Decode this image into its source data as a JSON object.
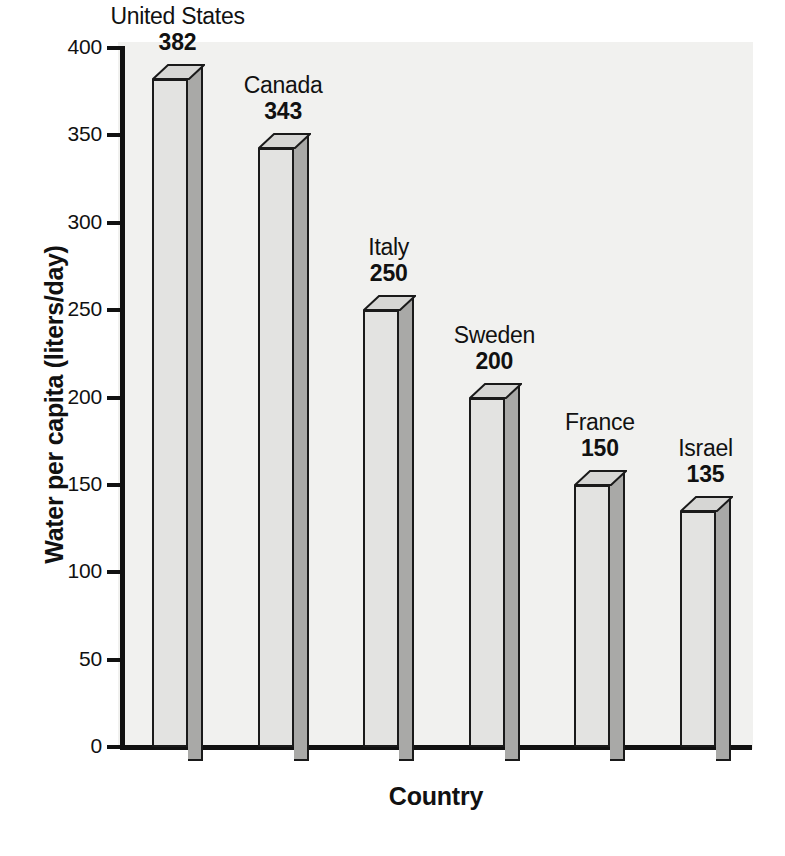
{
  "chart_data": {
    "type": "bar",
    "title": "",
    "xlabel": "Country",
    "ylabel": "Water per capita (liters/day)",
    "categories": [
      "United States",
      "Canada",
      "Italy",
      "Sweden",
      "France",
      "Israel"
    ],
    "values": [
      382,
      343,
      250,
      200,
      150,
      135
    ],
    "value_labels": [
      "382",
      "343",
      "250",
      "200",
      "150",
      "135"
    ],
    "ylim": [
      0,
      400
    ],
    "yticks": [
      0,
      50,
      100,
      150,
      200,
      250,
      300,
      350,
      400
    ],
    "ytick_labels": [
      "0",
      "50",
      "100",
      "150",
      "200",
      "250",
      "300",
      "350",
      "400"
    ],
    "xtick_labels": [],
    "grid": false,
    "legend": false,
    "style": "3d-column",
    "series": [
      {
        "name": "Water per capita",
        "values": [
          382,
          343,
          250,
          200,
          150,
          135
        ]
      }
    ]
  },
  "colors": {
    "bar_front": "#e3e3e1",
    "bar_side": "#a9a9a7",
    "bar_top": "#d6d6d4",
    "bar_outline": "#1a1a1a",
    "axis": "#111111",
    "plot_background": "#f1f1ef",
    "figure_background": "#ffffff",
    "text": "#111111"
  },
  "axes": {
    "y_title": "Water per capita (liters/day)",
    "x_title": "Country"
  },
  "bars": [
    {
      "name": "United States",
      "value": "382"
    },
    {
      "name": "Canada",
      "value": "343"
    },
    {
      "name": "Italy",
      "value": "250"
    },
    {
      "name": "Sweden",
      "value": "200"
    },
    {
      "name": "France",
      "value": "150"
    },
    {
      "name": "Israel",
      "value": "135"
    }
  ],
  "yticks": [
    {
      "label": "400"
    },
    {
      "label": "350"
    },
    {
      "label": "300"
    },
    {
      "label": "250"
    },
    {
      "label": "200"
    },
    {
      "label": "150"
    },
    {
      "label": "100"
    },
    {
      "label": "50"
    },
    {
      "label": "0"
    }
  ]
}
